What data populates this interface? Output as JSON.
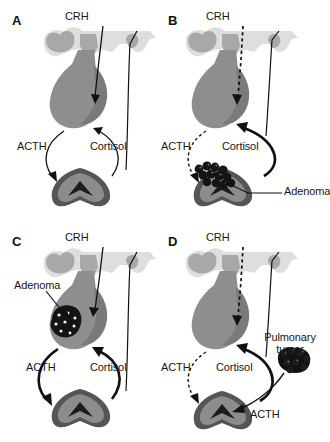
{
  "figure": {
    "type": "medical-diagram",
    "panel_count": 4,
    "background_color": "#ffffff"
  },
  "colors": {
    "brain_light": "#dedede",
    "brain_mid": "#a8a8a8",
    "pituitary": "#8e8e8e",
    "pituitary_dark": "#7a7a7a",
    "adrenal_body": "#8c8c8c",
    "adrenal_rim": "#555555",
    "adrenal_medulla": "#1c1c1c",
    "tumor": "#111111",
    "stroke": "#111111",
    "text": "#161616"
  },
  "panels": [
    {
      "id": "a",
      "letter": "A",
      "caption": "Normal HPA axis",
      "labels": [
        {
          "name": "crh",
          "text": "CRH"
        },
        {
          "name": "acth",
          "text": "ACTH"
        },
        {
          "name": "cortisol",
          "text": "Cortisol"
        }
      ],
      "arrows": [
        {
          "name": "crh-arrow",
          "style": "solid",
          "from": "hypothalamus",
          "to": "pituitary"
        },
        {
          "name": "acth-arrow",
          "style": "solid",
          "from": "pituitary",
          "to": "adrenal"
        },
        {
          "name": "cortisol-arrow",
          "style": "solid",
          "from": "adrenal",
          "to": "hypothalamus"
        }
      ],
      "tumor": null
    },
    {
      "id": "b",
      "letter": "B",
      "caption": "Adrenal adenoma",
      "labels": [
        {
          "name": "crh",
          "text": "CRH"
        },
        {
          "name": "acth",
          "text": "ACTH"
        },
        {
          "name": "cortisol",
          "text": "Cortisol"
        },
        {
          "name": "adenoma",
          "text": "Adenoma"
        }
      ],
      "arrows": [
        {
          "name": "crh-arrow",
          "style": "dashed",
          "from": "hypothalamus",
          "to": "pituitary"
        },
        {
          "name": "acth-arrow",
          "style": "dashed",
          "from": "pituitary",
          "to": "adrenal"
        },
        {
          "name": "cortisol-arrow",
          "style": "solid-thick",
          "from": "adrenal",
          "to": "pituitary"
        }
      ],
      "tumor": {
        "name": "adrenal-adenoma",
        "location": "adrenal-gland",
        "style": "dark-cluster"
      }
    },
    {
      "id": "c",
      "letter": "C",
      "caption": "Pituitary adenoma (Cushing disease)",
      "labels": [
        {
          "name": "crh",
          "text": "CRH"
        },
        {
          "name": "acth",
          "text": "ACTH"
        },
        {
          "name": "cortisol",
          "text": "Cortisol"
        },
        {
          "name": "adenoma",
          "text": "Adenoma"
        }
      ],
      "arrows": [
        {
          "name": "crh-arrow",
          "style": "solid",
          "from": "hypothalamus",
          "to": "pituitary"
        },
        {
          "name": "acth-arrow",
          "style": "solid-thick",
          "from": "pituitary",
          "to": "adrenal"
        },
        {
          "name": "cortisol-arrow",
          "style": "solid-thick",
          "from": "adrenal",
          "to": "hypothalamus"
        }
      ],
      "tumor": {
        "name": "pituitary-adenoma",
        "location": "pituitary-gland",
        "style": "dark-speckled"
      }
    },
    {
      "id": "d",
      "letter": "D",
      "caption": "Ectopic ACTH from pulmonary tumor",
      "labels": [
        {
          "name": "crh",
          "text": "CRH"
        },
        {
          "name": "acth",
          "text": "ACTH"
        },
        {
          "name": "cortisol",
          "text": "Cortisol"
        },
        {
          "name": "pulmonary-tumor",
          "text": "Pulmonary tumor"
        },
        {
          "name": "ectopic-acth",
          "text": "ACTH"
        }
      ],
      "arrows": [
        {
          "name": "crh-arrow",
          "style": "dashed",
          "from": "hypothalamus",
          "to": "pituitary"
        },
        {
          "name": "acth-arrow",
          "style": "dashed",
          "from": "pituitary",
          "to": "adrenal"
        },
        {
          "name": "cortisol-arrow",
          "style": "solid-thick",
          "from": "adrenal",
          "to": "pituitary"
        },
        {
          "name": "ectopic-acth-arrow",
          "style": "solid",
          "from": "pulmonary-tumor",
          "to": "adrenal"
        }
      ],
      "tumor": {
        "name": "pulmonary-tumor",
        "location": "lung",
        "style": "dark-cluster-mass"
      }
    }
  ]
}
